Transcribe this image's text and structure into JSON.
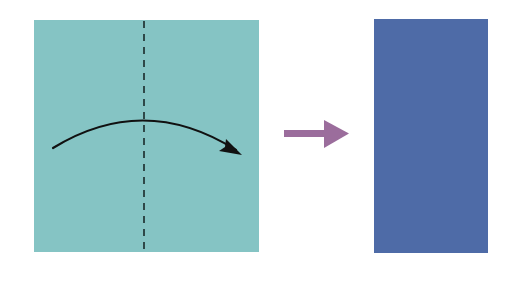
{
  "diagram": {
    "type": "origami-fold-instruction",
    "steps": [
      {
        "id": "before",
        "shape": "square",
        "color": "#85c4c4",
        "fold_line": {
          "orientation": "vertical",
          "style": "dashed",
          "color": "#1a2a2a"
        },
        "fold_arrow": {
          "direction": "left-to-right",
          "style": "curved",
          "color": "#111111"
        }
      },
      {
        "id": "transition",
        "shape": "arrow",
        "direction": "right",
        "color": "#9b6d9c"
      },
      {
        "id": "after",
        "shape": "rectangle",
        "orientation": "portrait",
        "color": "#4e6ba7"
      }
    ]
  }
}
